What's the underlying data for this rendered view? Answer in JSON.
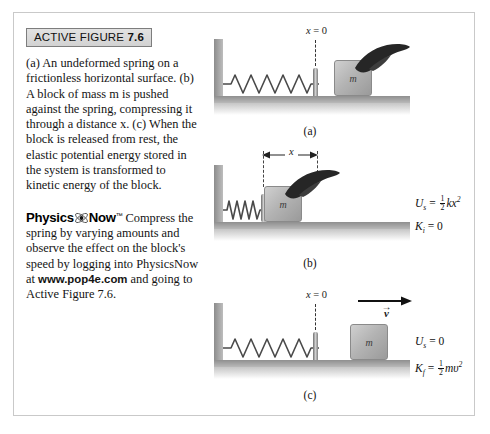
{
  "header": {
    "label": "ACTIVE FIGURE",
    "number": "7.6"
  },
  "caption": {
    "part_a": "(a) An undeformed spring on a frictionless horizontal surface.",
    "part_b": "(b) A block of mass m is pushed against the spring, compressing it through a distance x.",
    "part_c": "(c) When the block is released from rest, the elastic potential energy stored in the system is transformed to kinetic energy of the block.",
    "mass_symbol": "m",
    "distance_symbol": "x"
  },
  "physicsnow": {
    "brand_first": "Physics",
    "brand_second": "Now",
    "trademark": "™",
    "text_before_url": "Compress the spring by varying amounts and observe the effect on the block's speed by logging into PhysicsNow at ",
    "url": "www.pop4e.com",
    "text_after_url": " and going to Active Figure 7.6."
  },
  "panels": [
    {
      "id": "a",
      "caption": "(a)",
      "origin_label_prefix": "x",
      "origin_label_value": "= 0",
      "block_label": "m",
      "has_hand": true,
      "spring_state": "relaxed",
      "equations": []
    },
    {
      "id": "b",
      "caption": "(b)",
      "dimension_label": "x",
      "block_label": "m",
      "has_hand": true,
      "spring_state": "compressed",
      "equations": [
        {
          "lhs_symbol": "U",
          "lhs_subscript": "s",
          "relation": "=",
          "coefficient_num": "1",
          "coefficient_den": "2",
          "body": "kx",
          "exponent": "2"
        },
        {
          "lhs_symbol": "K",
          "lhs_subscript": "i",
          "relation": "=",
          "body": "0"
        }
      ]
    },
    {
      "id": "c",
      "caption": "(c)",
      "origin_label_prefix": "x",
      "origin_label_value": "= 0",
      "block_label": "m",
      "has_hand": false,
      "spring_state": "relaxed",
      "velocity_label": "v",
      "velocity_vector_glyph": "→",
      "equations": [
        {
          "lhs_symbol": "U",
          "lhs_subscript": "s",
          "relation": "=",
          "body": "0"
        },
        {
          "lhs_symbol": "K",
          "lhs_subscript": "f",
          "relation": "=",
          "coefficient_num": "1",
          "coefficient_den": "2",
          "body": "mυ",
          "exponent": "2"
        }
      ]
    }
  ],
  "colors": {
    "block_fill": "#b4b4b4",
    "ground": "#8f8f8f",
    "wall": "#8c8c8c",
    "header_bg": "#dcdcdc",
    "border": "#c9c9c9"
  }
}
